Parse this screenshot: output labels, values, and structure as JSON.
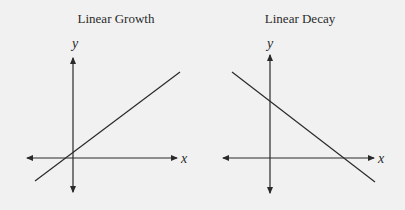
{
  "panels": [
    {
      "title": "Linear Growth",
      "x_label": "x",
      "y_label": "y",
      "line": "increasing"
    },
    {
      "title": "Linear Decay",
      "x_label": "x",
      "y_label": "y",
      "line": "decreasing"
    }
  ],
  "colors": {
    "background": "#f1f1f1",
    "ink": "#2a2a2a"
  }
}
